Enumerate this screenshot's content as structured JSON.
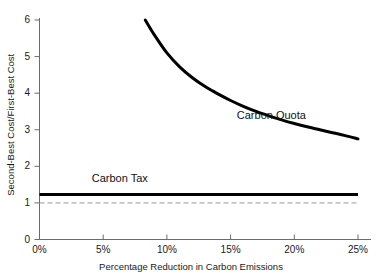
{
  "chart_data": {
    "type": "line",
    "title": "",
    "xlabel": "Percentage Reduction in Carbon Emissions",
    "ylabel": "Second-Best Cost/First-Best Cost",
    "xlim": [
      0,
      25
    ],
    "ylim": [
      0,
      6
    ],
    "grid": false,
    "legend_position": "inline-annotations",
    "x_ticks": [
      "0%",
      "5%",
      "10%",
      "15%",
      "20%",
      "25%"
    ],
    "x_tick_values": [
      0,
      5,
      10,
      15,
      20,
      25
    ],
    "y_ticks": [
      "0",
      "1",
      "2",
      "3",
      "4",
      "5",
      "6"
    ],
    "y_tick_values": [
      0,
      1,
      2,
      3,
      4,
      5,
      6
    ],
    "series": [
      {
        "name": "Carbon Quota",
        "style": "solid-thick",
        "color": "#000000",
        "x": [
          8.3,
          9,
          10,
          11,
          12,
          13,
          14,
          15,
          16,
          17,
          18,
          19,
          20,
          21,
          22,
          23,
          24,
          25
        ],
        "values": [
          6.0,
          5.6,
          5.1,
          4.72,
          4.42,
          4.18,
          3.98,
          3.8,
          3.64,
          3.5,
          3.38,
          3.27,
          3.17,
          3.08,
          3.0,
          2.92,
          2.84,
          2.75
        ]
      },
      {
        "name": "Carbon Tax",
        "style": "solid-thick",
        "color": "#000000",
        "x": [
          0,
          25
        ],
        "values": [
          1.23,
          1.23
        ]
      },
      {
        "name": "reference-line",
        "style": "dashed",
        "color": "#999999",
        "x": [
          0,
          25
        ],
        "values": [
          1.0,
          1.0
        ]
      }
    ],
    "annotations": [
      {
        "text": "Carbon Quota",
        "x": 18.2,
        "y": 3.35
      },
      {
        "text": "Carbon Tax",
        "x": 6.3,
        "y": 1.62
      }
    ]
  },
  "colors": {
    "axis": "#6b6b6b",
    "series": "#000000",
    "reference": "#9a9a9a",
    "text": "#1a1a1a",
    "background": "#ffffff"
  }
}
